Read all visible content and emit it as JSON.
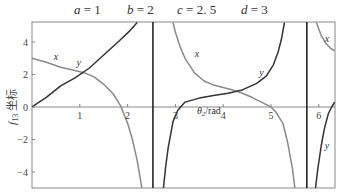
{
  "chart_data": {
    "type": "line",
    "title": "",
    "parameters": [
      {
        "name": "a",
        "value": "1"
      },
      {
        "name": "b",
        "value": "2"
      },
      {
        "name": "c",
        "value": "2. 5"
      },
      {
        "name": "d",
        "value": "3"
      }
    ],
    "xlabel": "θ2/rad",
    "ylabel": "f13 坐标",
    "xlim": [
      0,
      6.33
    ],
    "ylim": [
      -5,
      5.2
    ],
    "xticks": [
      "1",
      "2",
      "3",
      "4",
      "5",
      "6"
    ],
    "yticks": [
      "4",
      "2",
      "0",
      "-2",
      "-4"
    ],
    "grid": false,
    "vertical_asymptotes": [
      2.53,
      5.75
    ],
    "series": [
      {
        "name": "x",
        "color": "#8a8a8a",
        "points": [
          [
            0,
            3.0
          ],
          [
            0.3,
            2.75
          ],
          [
            0.6,
            2.45
          ],
          [
            0.9,
            2.25
          ],
          [
            1.1,
            2.1
          ],
          [
            1.3,
            1.85
          ],
          [
            1.5,
            1.4
          ],
          [
            1.7,
            0.8
          ],
          [
            1.85,
            0.1
          ],
          [
            2.0,
            -1.0
          ],
          [
            2.1,
            -2.0
          ],
          [
            2.2,
            -3.3
          ],
          [
            2.3,
            -5.0
          ],
          null,
          [
            2.95,
            5.2
          ],
          [
            3.0,
            4.6
          ],
          [
            3.1,
            3.7
          ],
          [
            3.2,
            3.0
          ],
          [
            3.4,
            2.1
          ],
          [
            3.6,
            1.6
          ],
          [
            3.8,
            1.35
          ],
          [
            4.0,
            1.2
          ],
          [
            4.2,
            1.05
          ],
          [
            4.4,
            0.85
          ],
          [
            4.6,
            0.6
          ],
          [
            4.8,
            0.3
          ],
          [
            5.0,
            0.0
          ],
          [
            5.1,
            -0.3
          ],
          [
            5.25,
            -1.0
          ],
          [
            5.35,
            -2.2
          ],
          [
            5.45,
            -3.8
          ],
          [
            5.5,
            -5.0
          ],
          null,
          [
            5.95,
            5.2
          ],
          [
            6.05,
            4.4
          ],
          [
            6.15,
            3.9
          ],
          [
            6.25,
            3.6
          ],
          [
            6.33,
            3.45
          ]
        ]
      },
      {
        "name": "y",
        "color": "#333333",
        "points": [
          [
            0,
            0.0
          ],
          [
            0.3,
            0.6
          ],
          [
            0.6,
            1.3
          ],
          [
            0.9,
            1.8
          ],
          [
            1.2,
            2.4
          ],
          [
            1.5,
            3.2
          ],
          [
            1.8,
            4.0
          ],
          [
            2.05,
            4.7
          ],
          [
            2.2,
            5.2
          ],
          null,
          [
            2.75,
            -5.0
          ],
          [
            2.8,
            -3.6
          ],
          [
            2.85,
            -2.5
          ],
          [
            2.95,
            -0.9
          ],
          [
            3.05,
            -0.2
          ],
          [
            3.2,
            0.3
          ],
          [
            3.5,
            0.55
          ],
          [
            3.8,
            0.7
          ],
          [
            4.1,
            0.85
          ],
          [
            4.4,
            1.05
          ],
          [
            4.7,
            1.45
          ],
          [
            4.9,
            1.9
          ],
          [
            5.05,
            2.6
          ],
          [
            5.15,
            3.4
          ],
          [
            5.22,
            4.2
          ],
          [
            5.28,
            5.2
          ],
          null,
          [
            5.93,
            -5.0
          ],
          [
            5.98,
            -3.8
          ],
          [
            6.05,
            -2.4
          ],
          [
            6.12,
            -1.3
          ],
          [
            6.2,
            -0.4
          ],
          [
            6.27,
            0.0
          ],
          [
            6.33,
            0.3
          ]
        ]
      }
    ],
    "annotations": [
      {
        "text": "x",
        "x": 0.5,
        "y": 2.9
      },
      {
        "text": "y",
        "x": 0.98,
        "y": 2.55
      },
      {
        "text": "x",
        "x": 3.45,
        "y": 3.05
      },
      {
        "text": "y",
        "x": 4.8,
        "y": 1.9
      },
      {
        "text": "x",
        "x": 6.17,
        "y": 4.0
      },
      {
        "text": "y",
        "x": 6.17,
        "y": -2.6
      },
      {
        "text": "θ2/rad",
        "x": 3.7,
        "y": -0.45
      }
    ]
  }
}
